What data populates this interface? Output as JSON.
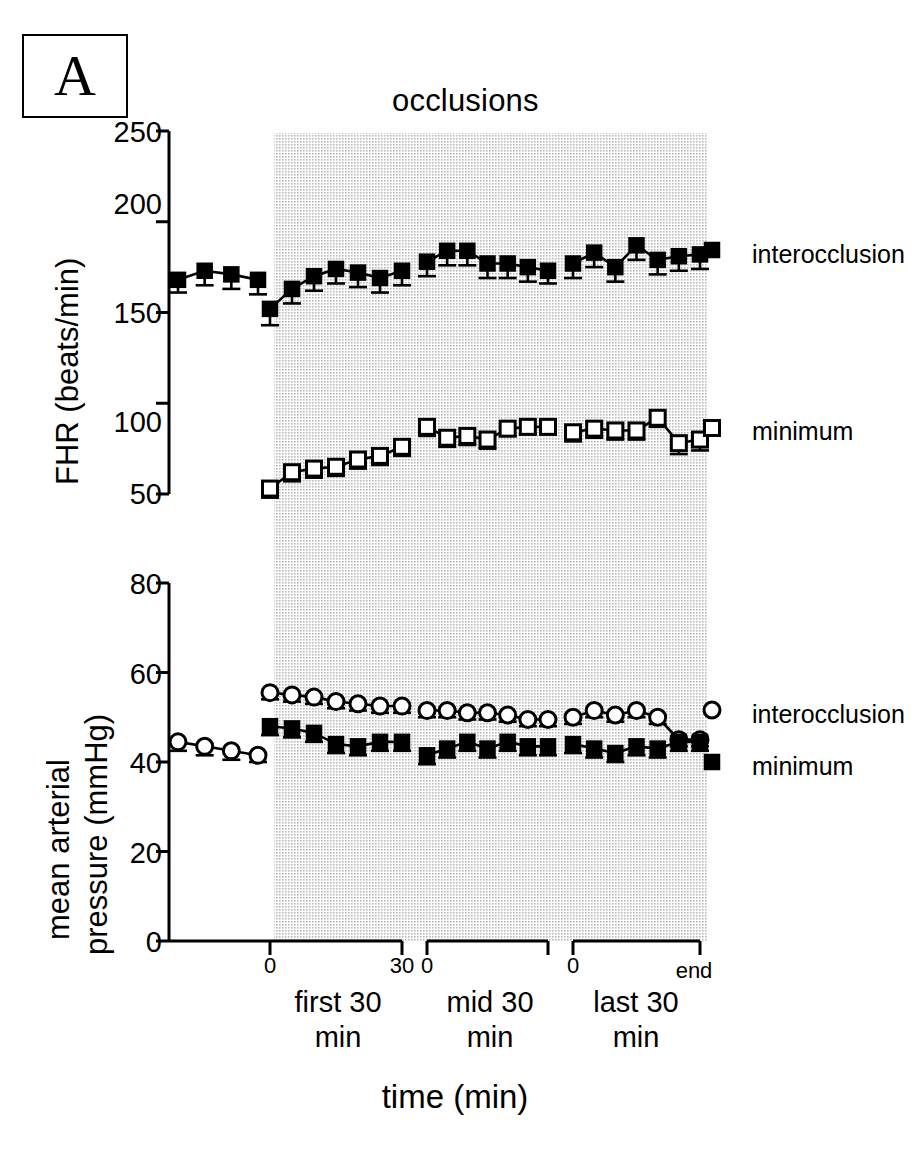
{
  "figure": {
    "panel_letter": "A",
    "title": "occlusions",
    "xaxis_title": "time (min)"
  },
  "top_panel": {
    "ylabel": "FHR (beats/min)",
    "yticks": [
      "250",
      "200",
      "150",
      "100",
      "50"
    ],
    "legend": {
      "interocclusion": "interocclusion",
      "minimum": "minimum"
    }
  },
  "bottom_panel": {
    "ylabel_line1": "mean arterial",
    "ylabel_line2": "pressure (mmHg)",
    "yticks": [
      "80",
      "60",
      "40",
      "20",
      "0"
    ],
    "legend": {
      "interocclusion": "interocclusion",
      "minimum": "minimum"
    }
  },
  "xaxis": {
    "segments": [
      {
        "start_label": "0",
        "end_label": "30",
        "group_line1": "first 30",
        "group_line2": "min"
      },
      {
        "start_label": "0",
        "end_label": "",
        "group_line1": "mid 30",
        "group_line2": "min"
      },
      {
        "start_label": "0",
        "end_label": "end",
        "group_line1": "last 30",
        "group_line2": "min"
      }
    ]
  },
  "colors": {
    "ink": "#000000",
    "shade": "#d9d9d9",
    "marker_open_fill": "#ffffff"
  },
  "chart_data": {
    "type": "line",
    "title": "occlusions",
    "xlabel": "time (min)",
    "panels": [
      {
        "name": "FHR",
        "ylabel": "FHR (beats/min)",
        "ylim": [
          50,
          250
        ],
        "yticks": [
          50,
          100,
          150,
          200,
          250
        ],
        "series": [
          {
            "name": "interocclusion",
            "marker": "filled-square",
            "segments": [
              {
                "label": "baseline",
                "x": [
                  -22,
                  -16,
                  -10,
                  -4
                ],
                "y": [
                  168,
                  173,
                  171,
                  168
                ],
                "err": [
                  7,
                  8,
                  8,
                  8
                ]
              },
              {
                "label": "first 30 min",
                "x": [
                  0,
                  5,
                  10,
                  15,
                  20,
                  25,
                  30
                ],
                "y": [
                  152,
                  163,
                  170,
                  174,
                  172,
                  169,
                  173
                ],
                "err": [
                  9,
                  8,
                  8,
                  8,
                  8,
                  8,
                  8
                ]
              },
              {
                "label": "mid 30 min",
                "x": [
                  0,
                  5,
                  10,
                  15,
                  20,
                  25,
                  30
                ],
                "y": [
                  178,
                  184,
                  184,
                  177,
                  177,
                  175,
                  173
                ],
                "err": [
                  8,
                  8,
                  8,
                  8,
                  8,
                  8,
                  7
                ]
              },
              {
                "label": "last 30 min",
                "x": [
                  0,
                  5,
                  10,
                  15,
                  20,
                  25,
                  30
                ],
                "y": [
                  177,
                  183,
                  175,
                  187,
                  179,
                  181,
                  182
                ],
                "err": [
                  8,
                  8,
                  8,
                  8,
                  8,
                  8,
                  8
                ]
              }
            ]
          },
          {
            "name": "minimum",
            "marker": "open-square",
            "segments": [
              {
                "label": "first 30 min",
                "x": [
                  0,
                  5,
                  10,
                  15,
                  20,
                  25,
                  30
                ],
                "y": [
                  53,
                  62,
                  64,
                  65,
                  69,
                  71,
                  76
                ],
                "err": [
                  5,
                  5,
                  5,
                  5,
                  5,
                  5,
                  5
                ]
              },
              {
                "label": "mid 30 min",
                "x": [
                  0,
                  5,
                  10,
                  15,
                  20,
                  25,
                  30
                ],
                "y": [
                  87,
                  81,
                  82,
                  80,
                  86,
                  87,
                  87
                ],
                "err": [
                  5,
                  5,
                  5,
                  5,
                  4,
                  4,
                  4
                ]
              },
              {
                "label": "last 30 min",
                "x": [
                  0,
                  5,
                  10,
                  15,
                  20,
                  25,
                  30
                ],
                "y": [
                  84,
                  86,
                  85,
                  85,
                  92,
                  78,
                  80
                ],
                "err": [
                  5,
                  5,
                  5,
                  5,
                  5,
                  6,
                  6
                ]
              }
            ]
          }
        ]
      },
      {
        "name": "mean arterial pressure",
        "ylabel": "mean arterial pressure (mmHg)",
        "ylim": [
          0,
          80
        ],
        "yticks": [
          0,
          20,
          40,
          60,
          80
        ],
        "series": [
          {
            "name": "interocclusion",
            "marker": "open-circle",
            "segments": [
              {
                "label": "baseline",
                "x": [
                  -22,
                  -16,
                  -10,
                  -4
                ],
                "y": [
                  44.5,
                  43.5,
                  42.5,
                  41.5
                ],
                "err": [
                  2,
                  2,
                  2,
                  1.5
                ]
              },
              {
                "label": "first 30 min",
                "x": [
                  0,
                  5,
                  10,
                  15,
                  20,
                  25,
                  30
                ],
                "y": [
                  55.5,
                  55,
                  54.5,
                  53.5,
                  53,
                  52.5,
                  52.5
                ],
                "err": [
                  1.5,
                  1.5,
                  1.5,
                  1.5,
                  1.5,
                  1.5,
                  1.5
                ]
              },
              {
                "label": "mid 30 min",
                "x": [
                  0,
                  5,
                  10,
                  15,
                  20,
                  25,
                  30
                ],
                "y": [
                  51.5,
                  51.5,
                  51,
                  51,
                  50.5,
                  49.5,
                  49.5
                ],
                "err": [
                  1.5,
                  1.5,
                  1.5,
                  1.5,
                  1.5,
                  1.5,
                  1.5
                ]
              },
              {
                "label": "last 30 min",
                "x": [
                  0,
                  5,
                  10,
                  15,
                  20,
                  25,
                  30
                ],
                "y": [
                  50,
                  51.5,
                  50.5,
                  51.5,
                  50,
                  45,
                  45
                ],
                "err": [
                  1.5,
                  1.5,
                  1.5,
                  1.5,
                  1.5,
                  1.5,
                  1.5
                ]
              }
            ]
          },
          {
            "name": "minimum",
            "marker": "filled-square",
            "segments": [
              {
                "label": "first 30 min",
                "x": [
                  0,
                  5,
                  10,
                  15,
                  20,
                  25,
                  30
                ],
                "y": [
                  48,
                  47.5,
                  46.5,
                  44,
                  43.5,
                  44.5,
                  44.5
                ],
                "err": [
                  2,
                  2,
                  2,
                  2,
                  2,
                  2,
                  2
                ]
              },
              {
                "label": "mid 30 min",
                "x": [
                  0,
                  5,
                  10,
                  15,
                  20,
                  25,
                  30
                ],
                "y": [
                  41.5,
                  43,
                  44.5,
                  43,
                  44.5,
                  43.5,
                  43.5
                ],
                "err": [
                  2,
                  2,
                  2,
                  2,
                  2,
                  2,
                  2
                ]
              },
              {
                "label": "last 30 min",
                "x": [
                  0,
                  5,
                  10,
                  15,
                  20,
                  25,
                  30
                ],
                "y": [
                  44,
                  43,
                  42,
                  43.5,
                  43,
                  44.5,
                  44.5
                ],
                "err": [
                  2,
                  2,
                  2,
                  2,
                  2,
                  2,
                  2
                ]
              }
            ]
          }
        ]
      }
    ],
    "shaded_region": {
      "label": "occlusions",
      "from": "first 30 min start",
      "to": "end"
    },
    "grid": false,
    "legend_position": "right"
  }
}
